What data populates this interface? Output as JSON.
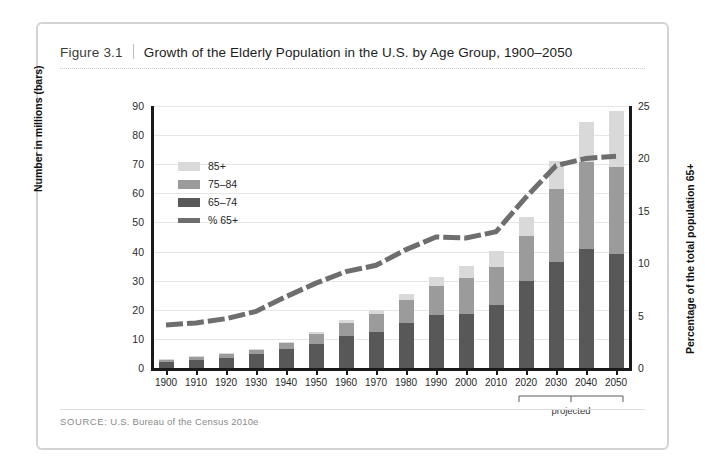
{
  "figure": {
    "number": "Figure 3.1",
    "title": "Growth of the Elderly Population in the U.S. by Age Group, 1900–2050",
    "source_label": "SOURCE:",
    "source_text": "U.S. Bureau of the Census 2010e",
    "projected_note": "projected",
    "colors": {
      "age_85_plus": "#d9d9d9",
      "age_75_84": "#9b9b9b",
      "age_65_74": "#585858",
      "percent_line": "#6e6e6e",
      "frame": "#d3d3d3",
      "gridline": "#e6e6e6",
      "axis": "#1a1a1a"
    }
  },
  "chart_data": {
    "type": "bar",
    "title": "Growth of the Elderly Population in the U.S. by Age Group, 1900–2050",
    "xlabel": "",
    "ylabel": "Number in millions (bars)",
    "y2label": "Percentage of the total population 65+",
    "ylim": [
      0,
      90
    ],
    "y2lim": [
      0,
      25
    ],
    "yticks": [
      0,
      10,
      20,
      30,
      40,
      50,
      60,
      70,
      80,
      90
    ],
    "y2ticks": [
      0,
      5,
      10,
      15,
      20,
      25
    ],
    "grid": true,
    "legend_position": "upper-left-inside",
    "categories": [
      "1900",
      "1910",
      "1920",
      "1930",
      "1940",
      "1950",
      "1960",
      "1970",
      "1980",
      "1990",
      "2000",
      "2010",
      "2020",
      "2030",
      "2040",
      "2050"
    ],
    "series": [
      {
        "name": "65–74",
        "type": "bar-segment",
        "color": "#585858",
        "values": [
          2.2,
          2.8,
          3.5,
          4.7,
          6.4,
          8.4,
          11.0,
          12.4,
          15.6,
          18.1,
          18.4,
          21.7,
          30.0,
          36.3,
          40.8,
          39.2
        ]
      },
      {
        "name": "75–84",
        "type": "bar-segment",
        "color": "#9b9b9b",
        "values": [
          0.8,
          1.0,
          1.3,
          1.6,
          2.3,
          3.3,
          4.6,
          6.1,
          7.7,
          10.1,
          12.4,
          13.1,
          15.4,
          25.1,
          30.1,
          30.0
        ]
      },
      {
        "name": "85+",
        "type": "bar-segment",
        "color": "#d9d9d9",
        "values": [
          0.1,
          0.2,
          0.2,
          0.3,
          0.4,
          0.6,
          0.9,
          1.5,
          2.2,
          3.1,
          4.2,
          5.5,
          6.6,
          9.6,
          13.6,
          19.0
        ]
      },
      {
        "name": "% 65+",
        "type": "line",
        "color": "#6e6e6e",
        "axis": "right",
        "values": [
          4.1,
          4.3,
          4.7,
          5.4,
          6.8,
          8.1,
          9.2,
          9.8,
          11.3,
          12.5,
          12.4,
          13.0,
          16.3,
          19.3,
          20.0,
          20.2
        ]
      }
    ],
    "annotations": [
      {
        "text": "projected",
        "span": [
          "2020",
          "2050"
        ]
      }
    ]
  },
  "legend": {
    "items": [
      {
        "label": "85+",
        "swatch": "age-85-plus"
      },
      {
        "label": "75–84",
        "swatch": "age-75-84"
      },
      {
        "label": "65–74",
        "swatch": "age-65-74"
      },
      {
        "label": "% 65+",
        "swatch": "percent-line"
      }
    ]
  }
}
